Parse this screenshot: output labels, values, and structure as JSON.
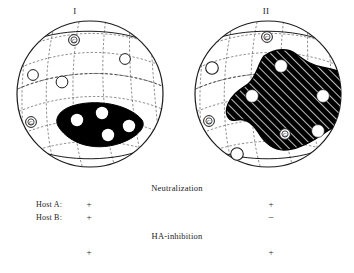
{
  "figure": {
    "panels": [
      {
        "id": "I",
        "title": "I",
        "region_style": "solid-black",
        "region_label": "antigenic-site-solid",
        "epitopes": [
          {
            "label": "G",
            "cx": 60,
            "cy": 22,
            "circled": true,
            "r": 5.2
          },
          {
            "label": "",
            "cx": 111,
            "cy": 41,
            "circled": false,
            "r": 5.2
          },
          {
            "label": "",
            "cx": 19,
            "cy": 57,
            "circled": false,
            "r": 5.2
          },
          {
            "label": "",
            "cx": 48,
            "cy": 64,
            "circled": false,
            "r": 5.8
          },
          {
            "label": "G",
            "cx": 17,
            "cy": 104,
            "circled": true,
            "r": 5.2
          }
        ],
        "site_dots": [
          {
            "cx": 63,
            "cy": 102
          },
          {
            "cx": 88,
            "cy": 95
          },
          {
            "cx": 94,
            "cy": 117
          },
          {
            "cx": 115,
            "cy": 108
          }
        ]
      },
      {
        "id": "II",
        "title": "II",
        "region_style": "hatched",
        "region_label": "antigenic-site-hatched",
        "epitopes": [
          {
            "label": "G",
            "cx": 75,
            "cy": 19,
            "circled": true,
            "r": 5.2
          },
          {
            "label": "",
            "cx": 20,
            "cy": 50,
            "circled": false,
            "r": 6.2
          },
          {
            "label": "G",
            "cx": 17,
            "cy": 103,
            "circled": true,
            "r": 5.2
          },
          {
            "label": "G",
            "cx": 93,
            "cy": 116,
            "circled": true,
            "r": 5.2
          },
          {
            "label": "",
            "cx": 45,
            "cy": 136,
            "circled": false,
            "r": 6.2
          }
        ],
        "site_dots": [
          {
            "cx": 89,
            "cy": 48
          },
          {
            "cx": 60,
            "cy": 78
          },
          {
            "cx": 131,
            "cy": 78
          },
          {
            "cx": 126,
            "cy": 113
          }
        ]
      }
    ],
    "results": {
      "neutralization_label": "Neutralization",
      "ha_inhibition_label": "HA-inhibition",
      "rows": [
        {
          "host": "Host A:",
          "panel_I": "+",
          "panel_II": "+"
        },
        {
          "host": "Host B:",
          "panel_I": "+",
          "panel_II": "−"
        }
      ],
      "ha_inhibition_values": {
        "panel_I": "+",
        "panel_II": "+"
      }
    },
    "colors": {
      "ink": "#1c1c1c",
      "grid": "#4a4a4a",
      "fill_solid": "#000000",
      "background": "#ffffff"
    }
  }
}
